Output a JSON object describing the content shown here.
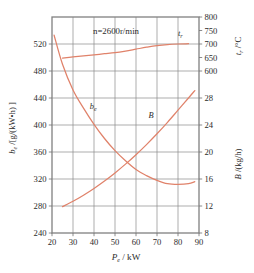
{
  "chart_data": {
    "type": "line",
    "title": "",
    "annotation": "n=2600r/min",
    "grid": true,
    "legend_position": "inline-labels",
    "xlabel": "P_e / kW",
    "xlabel_parts": {
      "base": "P",
      "sub": "e",
      "unit": "/ kW"
    },
    "xlim": [
      20,
      90
    ],
    "xticks": [
      20,
      30,
      40,
      50,
      60,
      70,
      80,
      90
    ],
    "xticklabels": [
      "20",
      "30",
      "40",
      "50",
      "60",
      "70",
      "80",
      "90"
    ],
    "axes": [
      {
        "id": "left",
        "label": "b_e /[g/(kW·h)]",
        "label_parts": {
          "base": "b",
          "sub": "e",
          "unit": "/[g/(kW•h) ]"
        },
        "lim": [
          240,
          560
        ],
        "ticks": [
          240,
          280,
          320,
          360,
          400,
          440,
          480,
          520
        ],
        "ticklabels": [
          "240",
          "280",
          "320",
          "360",
          "400",
          "440",
          "480",
          "520"
        ],
        "side": "left"
      },
      {
        "id": "right-top",
        "label": "t_r /°C",
        "label_parts": {
          "base": "t",
          "sub": "r",
          "unit": "/°C"
        },
        "lim": [
          600,
          800
        ],
        "ticks": [
          600,
          650,
          700,
          750,
          800
        ],
        "ticklabels": [
          "600",
          "650",
          "700",
          "750",
          "800"
        ],
        "side": "right",
        "region": "upper"
      },
      {
        "id": "right-bottom",
        "label": "B/(kg/h)",
        "label_parts": {
          "base": "B",
          "sub": "",
          "unit": "/(kg/h)"
        },
        "lim": [
          8,
          28
        ],
        "ticks": [
          8,
          12,
          16,
          20,
          24,
          28
        ],
        "ticklabels": [
          "8",
          "12",
          "16",
          "20",
          "24",
          "28"
        ],
        "side": "right",
        "region": "lower"
      }
    ],
    "series": [
      {
        "name": "t_r",
        "label": "t_r",
        "label_parts": {
          "base": "t",
          "sub": "r"
        },
        "axis": "right-top",
        "unit": "°C",
        "color": "#e0826a",
        "x": [
          25,
          30,
          35,
          40,
          45,
          50,
          55,
          60,
          65,
          70,
          75,
          80,
          85
        ],
        "values": [
          648,
          652,
          656,
          660,
          664,
          668,
          674,
          681,
          688,
          694,
          698,
          700,
          701
        ]
      },
      {
        "name": "b_e",
        "label": "b_e",
        "label_parts": {
          "base": "b",
          "sub": "e"
        },
        "axis": "left",
        "unit": "g/(kW·h)",
        "color": "#e0826a",
        "x": [
          21,
          25,
          30,
          35,
          40,
          45,
          50,
          55,
          60,
          65,
          70,
          75,
          80,
          85,
          88
        ],
        "values": [
          533,
          490,
          452,
          425,
          401,
          380,
          362,
          347,
          334,
          325,
          318,
          313,
          312,
          313,
          316
        ]
      },
      {
        "name": "B",
        "label": "B",
        "label_parts": {
          "base": "B",
          "sub": ""
        },
        "axis": "right-bottom",
        "unit": "kg/h",
        "color": "#e0826a",
        "x": [
          25,
          30,
          35,
          40,
          45,
          50,
          55,
          60,
          65,
          70,
          75,
          80,
          85,
          88
        ],
        "values": [
          11.9,
          12.7,
          13.6,
          14.6,
          15.7,
          16.9,
          18.2,
          19.6,
          21.1,
          22.7,
          24.4,
          26.2,
          28.0,
          29.1
        ]
      }
    ],
    "curve_labels": [
      {
        "name": "t_r-curve-label",
        "text": "t",
        "sub": "r",
        "x": 80,
        "axis": "right-top",
        "y": 730
      },
      {
        "name": "b_e-curve-label",
        "text": "b",
        "sub": "e",
        "x": 38,
        "axis": "left",
        "y": 424
      },
      {
        "name": "B-curve-label",
        "text": "B",
        "sub": "",
        "x": 66,
        "axis": "right-bottom",
        "y": 25.0
      }
    ],
    "colors": {
      "curve": "#e0826a",
      "frame": "#808080",
      "grid": "#8a8a8a",
      "text": "#2b2b2b",
      "background": "#ffffff"
    }
  }
}
